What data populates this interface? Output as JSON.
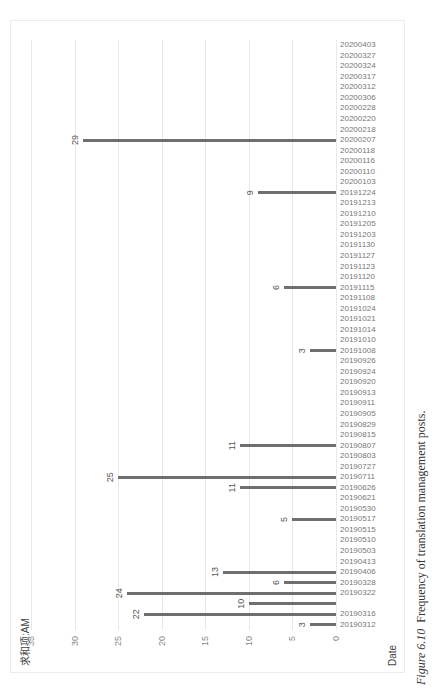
{
  "chart_data": {
    "type": "bar",
    "orientation": "rotated -90deg (columns appear horizontal, values increase leftward)",
    "legend": "求和项:AM",
    "xlabel": "Date",
    "ylabel": "Post counts",
    "ylim": [
      0,
      35
    ],
    "yticks": [
      0,
      5,
      10,
      15,
      20,
      25,
      30,
      35
    ],
    "grid": true,
    "categories": [
      "20190312",
      "20190316",
      "20190319",
      "20190322",
      "20190328",
      "20190406",
      "20190413",
      "20190503",
      "20190510",
      "20190515",
      "20190517",
      "20190530",
      "20190621",
      "20190626",
      "20190711",
      "20190727",
      "20190803",
      "20190807",
      "20190815",
      "20190829",
      "20190905",
      "20190911",
      "20190913",
      "20190920",
      "20190924",
      "20190926",
      "20191008",
      "20191010",
      "20191014",
      "20191021",
      "20191024",
      "20191108",
      "20191115",
      "20191120",
      "20191123",
      "20191127",
      "20191130",
      "20191203",
      "20191205",
      "20191210",
      "20191213",
      "20191224",
      "20200103",
      "20200110",
      "20200116",
      "20200118",
      "20200207",
      "20200218",
      "20200220",
      "20200228",
      "20200306",
      "20200312",
      "20200317",
      "20200324",
      "20200327",
      "20200403"
    ],
    "tick_labels": [
      "20190312",
      "20190316",
      "",
      "20190322",
      "20190328",
      "20190406",
      "20190413",
      "20190503",
      "20190510",
      "20190515",
      "20190517",
      "20190530",
      "20190621",
      "20190626",
      "20190711",
      "20190727",
      "20190803",
      "20190807",
      "20190815",
      "20190829",
      "20190905",
      "20190911",
      "20190913",
      "20190920",
      "20190924",
      "20190926",
      "20191008",
      "20191010",
      "20191014",
      "20191021",
      "20191024",
      "20191108",
      "20191115",
      "20191120",
      "20191123",
      "20191127",
      "20191130",
      "20191203",
      "20191205",
      "20191210",
      "20191213",
      "20191224",
      "20200103",
      "20200110",
      "20200116",
      "20200118",
      "20200207",
      "20200218",
      "20200220",
      "20200228",
      "20200306",
      "20200312",
      "20200317",
      "20200324",
      "20200327",
      "20200403"
    ],
    "values": [
      3,
      22,
      10,
      24,
      6,
      13,
      0,
      0,
      0,
      0,
      5,
      0,
      0,
      11,
      25,
      0,
      0,
      11,
      0,
      0,
      0,
      0,
      0,
      0,
      0,
      0,
      3,
      0,
      0,
      0,
      0,
      0,
      6,
      0,
      0,
      0,
      0,
      0,
      0,
      0,
      0,
      9,
      0,
      0,
      0,
      0,
      29,
      0,
      0,
      0,
      0,
      0,
      0,
      0,
      0,
      0
    ]
  },
  "caption": {
    "figure_label": "Figure 6.10",
    "text": "Frequency of translation management posts."
  }
}
